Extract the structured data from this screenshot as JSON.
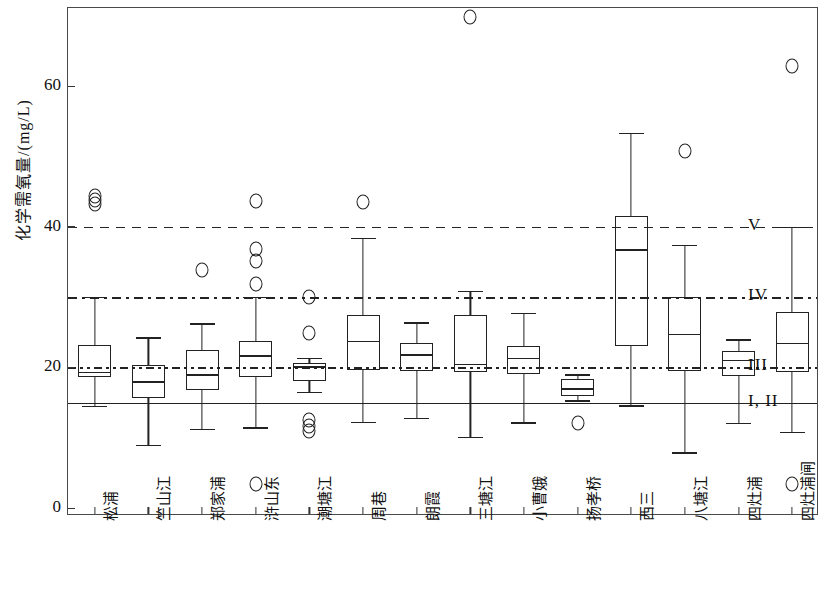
{
  "chart_data": {
    "type": "box",
    "title": "",
    "xlabel": "",
    "ylabel": "化学需氧量/(mg/L)",
    "ylim": [
      0,
      72
    ],
    "yticks": [
      0,
      20,
      40,
      60
    ],
    "ytick_labels": [
      "0",
      "20",
      "40",
      "60"
    ],
    "grid": false,
    "legend_position": "right",
    "categories": [
      "松浦",
      "竺山江",
      "郑家浦",
      "浒山东",
      "潮塘江",
      "周巷",
      "朗霞",
      "三塘江",
      "小曹娥",
      "扬孝桥",
      "西三",
      "八塘江",
      "四灶浦",
      "四灶浦闸"
    ],
    "reference_lines": [
      {
        "label": "V",
        "value": 40,
        "style": "dashed"
      },
      {
        "label": "IV",
        "value": 30,
        "style": "dash-dot"
      },
      {
        "label": "III",
        "value": 20,
        "style": "dash-dot-dot"
      },
      {
        "label": "I, II",
        "value": 15,
        "style": "solid"
      }
    ],
    "boxes": [
      {
        "category": "松浦",
        "whisker_low": 14.5,
        "q1": 18.6,
        "median": 19.4,
        "q3": 23.2,
        "whisker_high": 30.0,
        "outliers": [
          43.2,
          43.8,
          44.4
        ]
      },
      {
        "category": "竺山江",
        "whisker_low": 9.0,
        "q1": 15.7,
        "median": 18.0,
        "q3": 20.3,
        "whisker_high": 24.3,
        "outliers": []
      },
      {
        "category": "郑家浦",
        "whisker_low": 11.3,
        "q1": 16.8,
        "median": 19.0,
        "q3": 22.5,
        "whisker_high": 26.3,
        "outliers": [
          33.9
        ]
      },
      {
        "category": "浒山东",
        "whisker_low": 11.5,
        "q1": 18.7,
        "median": 21.7,
        "q3": 23.7,
        "whisker_high": 30.0,
        "outliers": [
          3.4,
          31.8,
          35.1,
          36.9,
          43.7
        ]
      },
      {
        "category": "潮塘江",
        "whisker_low": 16.5,
        "q1": 18.0,
        "median": 20.2,
        "q3": 20.6,
        "whisker_high": 21.4,
        "outliers": [
          11.0,
          11.7,
          12.5,
          24.9,
          30.0
        ]
      },
      {
        "category": "周巷",
        "whisker_low": 12.3,
        "q1": 19.6,
        "median": 23.8,
        "q3": 27.4,
        "whisker_high": 38.4,
        "outliers": [
          43.5
        ]
      },
      {
        "category": "朗霞",
        "whisker_low": 12.8,
        "q1": 19.5,
        "median": 21.9,
        "q3": 23.4,
        "whisker_high": 26.4,
        "outliers": []
      },
      {
        "category": "三塘江",
        "whisker_low": 10.1,
        "q1": 19.4,
        "median": 20.5,
        "q3": 27.5,
        "whisker_high": 30.9,
        "outliers": [
          69.9
        ]
      },
      {
        "category": "小曹娥",
        "whisker_low": 12.2,
        "q1": 19.0,
        "median": 21.4,
        "q3": 23.1,
        "whisker_high": 27.8,
        "outliers": []
      },
      {
        "category": "扬孝桥",
        "whisker_low": 15.3,
        "q1": 16.0,
        "median": 17.0,
        "q3": 18.3,
        "whisker_high": 19.0,
        "outliers": [
          12.1
        ]
      },
      {
        "category": "西三",
        "whisker_low": 14.6,
        "q1": 23.0,
        "median": 36.8,
        "q3": 41.5,
        "whisker_high": 53.4,
        "outliers": []
      },
      {
        "category": "八塘江",
        "whisker_low": 7.9,
        "q1": 19.5,
        "median": 24.8,
        "q3": 30.0,
        "whisker_high": 37.4,
        "outliers": [
          50.8
        ]
      },
      {
        "category": "四灶浦",
        "whisker_low": 12.1,
        "q1": 18.8,
        "median": 21.1,
        "q3": 22.4,
        "whisker_high": 24.0,
        "outliers": []
      },
      {
        "category": "四灶浦闸",
        "whisker_low": 10.8,
        "q1": 19.4,
        "median": 23.5,
        "q3": 27.9,
        "whisker_high": 40.0,
        "outliers": [
          3.4,
          62.9
        ]
      }
    ]
  }
}
